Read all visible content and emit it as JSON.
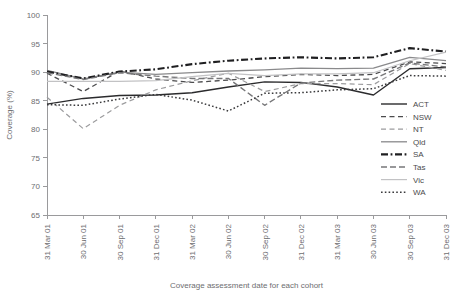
{
  "chart_data": {
    "type": "line",
    "title": "",
    "xlabel": "Coverage assessment date for each cohort",
    "ylabel": "Coverage (%)",
    "ylim": [
      65,
      100
    ],
    "yticks": [
      65,
      70,
      75,
      80,
      85,
      90,
      95,
      100
    ],
    "grid": false,
    "legend_position": "right-middle",
    "categories": [
      "31 Mar 01",
      "30 Jun 01",
      "30 Sep 01",
      "31 Dec 01",
      "31 Mar 02",
      "30 Jun 02",
      "30 Sep 02",
      "31 Dec 02",
      "31 Mar 03",
      "30 Jun 03",
      "30 Sep 03",
      "31 Dec 03"
    ],
    "series": [
      {
        "name": "ACT",
        "color": "#2b2b2d",
        "style": "solid",
        "width": 1.4,
        "values": [
          84.4,
          85.4,
          85.9,
          86.0,
          86.4,
          87.4,
          88.3,
          88.2,
          87.4,
          86.0,
          90.6,
          90.8
        ]
      },
      {
        "name": "NSW",
        "color": "#4b4b4d",
        "style": "dashed",
        "width": 1.3,
        "values": [
          89.8,
          86.6,
          90.2,
          88.8,
          88.2,
          88.6,
          89.2,
          89.6,
          89.4,
          89.6,
          91.8,
          91.5
        ]
      },
      {
        "name": "NT",
        "color": "#9c9c9e",
        "style": "dashed",
        "width": 1.2,
        "values": [
          85.6,
          80.1,
          84.2,
          86.9,
          88.5,
          89.8,
          86.6,
          88.0,
          88.0,
          87.8,
          91.5,
          90.3
        ]
      },
      {
        "name": "Qld",
        "color": "#8a8a8c",
        "style": "solid",
        "width": 1.3,
        "values": [
          90.3,
          88.8,
          90.0,
          89.6,
          89.9,
          90.2,
          90.4,
          90.7,
          90.6,
          90.7,
          92.6,
          92.0
        ]
      },
      {
        "name": "SA",
        "color": "#1f1f21",
        "style": "dashdot",
        "width": 2.1,
        "values": [
          90.1,
          88.9,
          90.1,
          90.5,
          91.4,
          92.0,
          92.4,
          92.6,
          92.4,
          92.6,
          94.2,
          93.6
        ]
      },
      {
        "name": "Tas",
        "color": "#777779",
        "style": "dashed",
        "width": 1.4,
        "values": [
          89.9,
          88.7,
          89.9,
          89.3,
          88.9,
          88.9,
          84.2,
          88.1,
          88.6,
          88.8,
          91.6,
          90.9
        ]
      },
      {
        "name": "Vic",
        "color": "#c2c2c4",
        "style": "solid",
        "width": 1.2,
        "values": [
          88.4,
          88.4,
          88.4,
          88.5,
          89.2,
          89.8,
          89.4,
          89.7,
          89.7,
          89.9,
          92.0,
          93.5
        ]
      },
      {
        "name": "WA",
        "color": "#3a3a3c",
        "style": "dotted",
        "width": 1.5,
        "values": [
          84.3,
          84.2,
          85.3,
          86.1,
          85.1,
          83.2,
          86.3,
          86.4,
          86.9,
          87.1,
          89.4,
          89.3
        ]
      }
    ]
  },
  "legend": {
    "items": [
      {
        "label": "ACT"
      },
      {
        "label": "NSW"
      },
      {
        "label": "NT"
      },
      {
        "label": "Qld"
      },
      {
        "label": "SA"
      },
      {
        "label": "Tas"
      },
      {
        "label": "Vic"
      },
      {
        "label": "WA"
      }
    ]
  }
}
